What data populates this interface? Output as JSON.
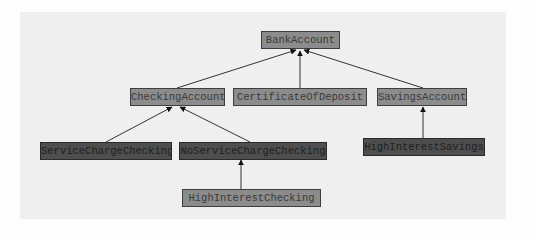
{
  "diagram": {
    "type": "class-hierarchy",
    "nodes": [
      {
        "id": "bank",
        "label": "BankAccount",
        "shade": "light"
      },
      {
        "id": "checking",
        "label": "CheckingAccount",
        "shade": "light"
      },
      {
        "id": "cd",
        "label": "CertificateOfDeposit",
        "shade": "light"
      },
      {
        "id": "savings",
        "label": "SavingsAccount",
        "shade": "light"
      },
      {
        "id": "scc",
        "label": "ServiceChargeChecking",
        "shade": "dark"
      },
      {
        "id": "nscc",
        "label": "NoServiceChargeChecking",
        "shade": "dark"
      },
      {
        "id": "his",
        "label": "HighInterestSavings",
        "shade": "dark"
      },
      {
        "id": "hic",
        "label": "HighInterestChecking",
        "shade": "light"
      }
    ],
    "edges": [
      {
        "from": "checking",
        "to": "bank"
      },
      {
        "from": "cd",
        "to": "bank"
      },
      {
        "from": "savings",
        "to": "bank"
      },
      {
        "from": "scc",
        "to": "checking"
      },
      {
        "from": "nscc",
        "to": "checking"
      },
      {
        "from": "his",
        "to": "savings"
      },
      {
        "from": "hic",
        "to": "nscc"
      }
    ],
    "colors": {
      "panel": "#efefef",
      "light_box": "#8c8c8c",
      "dark_box": "#4e4e4e",
      "edge": "#333333"
    }
  }
}
